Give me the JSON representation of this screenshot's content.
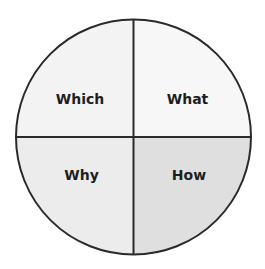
{
  "diagram": {
    "type": "quadrant-circle",
    "center": [
      133.5,
      137
    ],
    "radius": 117.5,
    "stroke_color": "#2a2a2a",
    "text_color": "#1e1e1e",
    "quadrants": [
      {
        "position": "top-left",
        "label": "Which",
        "fill": "#f3f3f3"
      },
      {
        "position": "top-right",
        "label": "What",
        "fill": "#f7f7f7"
      },
      {
        "position": "bottom-left",
        "label": "Why",
        "fill": "#ececec"
      },
      {
        "position": "bottom-right",
        "label": "How",
        "fill": "#dfdfdf"
      }
    ]
  }
}
